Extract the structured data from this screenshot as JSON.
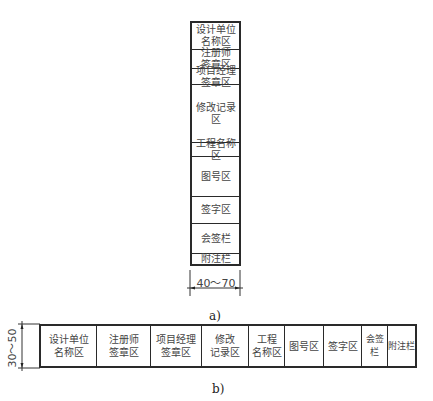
{
  "figure_a": {
    "caption": "a)",
    "dimension": "40～70",
    "rows": [
      {
        "label": "设计单位\n名称区",
        "top": 0,
        "height": 27
      },
      {
        "label": "注册师\n签章区",
        "top": 27,
        "height": 19
      },
      {
        "label": "项目经理\n签章区",
        "top": 46,
        "height": 16
      },
      {
        "label": "修改记录区",
        "top": 62,
        "height": 58
      },
      {
        "label": "工程名称区",
        "top": 120,
        "height": 14
      },
      {
        "label": "图号区",
        "top": 134,
        "height": 40
      },
      {
        "label": "签字区",
        "top": 174,
        "height": 27
      },
      {
        "label": "会签栏",
        "top": 201,
        "height": 30
      },
      {
        "label": "附注栏",
        "top": 231,
        "height": 12
      }
    ]
  },
  "figure_b": {
    "caption": "b)",
    "dimension": "30～50",
    "cols": [
      {
        "label": "设计单位\n名称区",
        "left": 0,
        "width": 56
      },
      {
        "label": "注册师\n签章区",
        "left": 56,
        "width": 54
      },
      {
        "label": "项目经理\n签章区",
        "left": 110,
        "width": 51
      },
      {
        "label": "修改\n记录区",
        "left": 161,
        "width": 47
      },
      {
        "label": "工程\n名称区",
        "left": 208,
        "width": 36
      },
      {
        "label": "图号区",
        "left": 244,
        "width": 39
      },
      {
        "label": "签字区",
        "left": 283,
        "width": 38
      },
      {
        "label": "会签栏",
        "left": 321,
        "width": 26
      },
      {
        "label": "附注栏",
        "left": 347,
        "width": 29
      }
    ]
  }
}
